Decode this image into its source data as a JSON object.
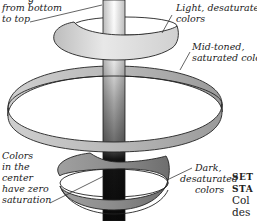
{
  "labels": {
    "top_partial": "g",
    "axis_line1": "from bottom",
    "axis_line2": "to top",
    "light_line1": "Light, desaturated",
    "light_line2": "colors",
    "mid_line1": "Mid-toned,",
    "mid_line2": "saturated colors",
    "center_line1": "Colors",
    "center_line2": "in the",
    "center_line3": "center",
    "center_line4": "have zero",
    "center_line5": "saturation",
    "dark_line1": "Dark,",
    "dark_line2": "desaturated",
    "dark_line3": "colors"
  },
  "sidebar_text": {
    "line1": "SET",
    "line2": "STA",
    "line3": "Col",
    "line4": "des",
    "line5": "wo"
  },
  "colors": {
    "ink": "#222222",
    "light_ring": "#e6e6e6",
    "mid_ring": "#c4c4c4",
    "dark_ring": "#8a8a8a",
    "pole_dark": "#111111"
  }
}
